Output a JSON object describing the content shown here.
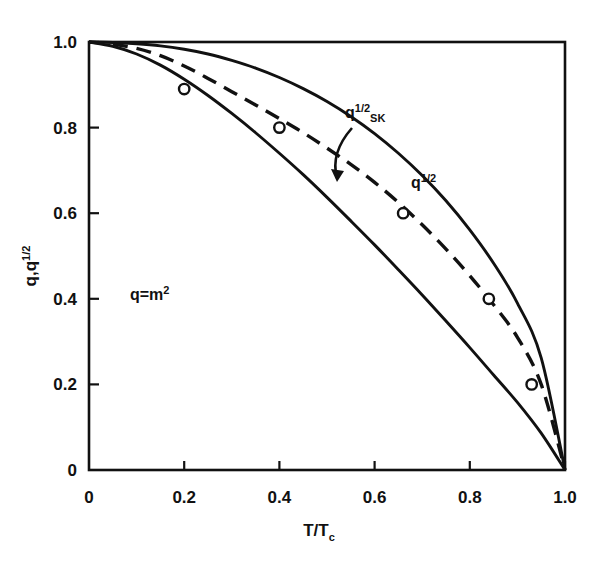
{
  "chart_data": {
    "type": "line",
    "title": "",
    "subtitle": "",
    "xlabel": "T/Tc",
    "xlabel_main": "T/T",
    "xlabel_sub": "c",
    "ylabel": "q,q^1/2",
    "ylabel_main": "q,q",
    "ylabel_sup": "1/2",
    "xlim": [
      0.0,
      1.0
    ],
    "ylim": [
      0.0,
      1.0
    ],
    "grid": false,
    "legend_position": "inline-annotations",
    "xticks": [
      0,
      0.2,
      0.4,
      0.6,
      0.8,
      1.0
    ],
    "xtick_labels": [
      "0",
      "0.2",
      "0.4",
      "0.6",
      "0.8",
      "1.0"
    ],
    "yticks": [
      0,
      0.2,
      0.4,
      0.6,
      0.8,
      1.0
    ],
    "ytick_labels": [
      "0",
      "0.2",
      "0.4",
      "0.6",
      "0.8",
      "1.0"
    ],
    "series": [
      {
        "name": "q^1/2",
        "style": "solid",
        "markers": false,
        "x": [
          0.0,
          0.05,
          0.1,
          0.15,
          0.2,
          0.25,
          0.3,
          0.35,
          0.4,
          0.45,
          0.5,
          0.55,
          0.6,
          0.65,
          0.7,
          0.75,
          0.8,
          0.85,
          0.9,
          0.95,
          1.0
        ],
        "values": [
          1.0,
          0.999,
          0.996,
          0.991,
          0.983,
          0.972,
          0.957,
          0.939,
          0.917,
          0.891,
          0.861,
          0.826,
          0.786,
          0.74,
          0.688,
          0.629,
          0.561,
          0.483,
          0.39,
          0.262,
          0.0
        ]
      },
      {
        "name": "q^1/2 SK",
        "style": "dashed",
        "markers": true,
        "x": [
          0.0,
          0.05,
          0.1,
          0.15,
          0.2,
          0.25,
          0.3,
          0.35,
          0.4,
          0.45,
          0.5,
          0.55,
          0.6,
          0.65,
          0.7,
          0.75,
          0.8,
          0.85,
          0.9,
          0.95,
          1.0
        ],
        "values": [
          1.0,
          0.995,
          0.985,
          0.968,
          0.944,
          0.915,
          0.884,
          0.853,
          0.821,
          0.788,
          0.752,
          0.714,
          0.672,
          0.625,
          0.573,
          0.516,
          0.454,
          0.386,
          0.31,
          0.2,
          0.0
        ],
        "marker_points": [
          {
            "x": 0.2,
            "y": 0.89
          },
          {
            "x": 0.4,
            "y": 0.8
          },
          {
            "x": 0.66,
            "y": 0.6
          },
          {
            "x": 0.84,
            "y": 0.4
          },
          {
            "x": 0.93,
            "y": 0.2
          }
        ]
      },
      {
        "name": "q = m^2",
        "style": "solid",
        "markers": false,
        "x": [
          0.0,
          0.05,
          0.1,
          0.15,
          0.2,
          0.25,
          0.3,
          0.35,
          0.4,
          0.45,
          0.5,
          0.55,
          0.6,
          0.65,
          0.7,
          0.75,
          0.8,
          0.85,
          0.9,
          0.95,
          1.0
        ],
        "values": [
          1.0,
          0.99,
          0.972,
          0.946,
          0.913,
          0.875,
          0.833,
          0.788,
          0.74,
          0.69,
          0.637,
          0.582,
          0.526,
          0.468,
          0.409,
          0.348,
          0.286,
          0.222,
          0.158,
          0.086,
          0.0
        ]
      }
    ],
    "annotations": [
      {
        "name": "sk-curve-label",
        "text": "q1/2SK",
        "base": "q",
        "sup": "1/2",
        "sub": "SK",
        "x_px": 345,
        "y_px": 118
      },
      {
        "name": "q-half-curve-label",
        "text": "q1/2",
        "base": "q",
        "sup": "1/2",
        "sub": "",
        "x_px": 411,
        "y_px": 188
      },
      {
        "name": "q-m-squared-label",
        "text": "q=m2",
        "base": "q=m",
        "sup": "2",
        "sub": "",
        "x_px": 130,
        "y_px": 300
      }
    ],
    "arrow": {
      "name": "sk-pointer-arrow",
      "from_x_px": 352,
      "from_y_px": 128,
      "to_x_px": 337,
      "to_y_px": 178
    }
  },
  "figure": {
    "background_color": "#ffffff",
    "line_color": "#111111",
    "marker_fill": "#ffffff"
  }
}
